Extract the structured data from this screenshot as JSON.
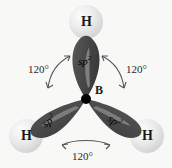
{
  "figure": {
    "background_color": "#f8f8f6",
    "central_atom": {
      "element": "B",
      "label": "B",
      "nucleus_color": "#000000"
    },
    "orbital_color": "#4a4a4a",
    "orbital_highlight_color": "#cfcfcf",
    "hydrogen_color": "#e8e8e8",
    "hydrogen_label": "H",
    "orbital_label_base": "sp",
    "orbital_label_exponent": "2",
    "angle_value": "120°",
    "orbitals": [
      {
        "id": "orbital-top",
        "label_base": "sp",
        "label_exponent": "2",
        "direction": "up",
        "bonded_atom": "H"
      },
      {
        "id": "orbital-lower-left",
        "label_base": "sp",
        "label_exponent": "2",
        "direction": "down-left",
        "bonded_atom": "H"
      },
      {
        "id": "orbital-lower-right",
        "label_base": "sp",
        "label_exponent": "2",
        "direction": "down-right",
        "bonded_atom": "H"
      }
    ],
    "hydrogens": [
      {
        "id": "hydrogen-top",
        "label": "H"
      },
      {
        "id": "hydrogen-lower-left",
        "label": "H"
      },
      {
        "id": "hydrogen-lower-right",
        "label": "H"
      }
    ],
    "angles": [
      {
        "id": "angle-upper-left",
        "label": "120°"
      },
      {
        "id": "angle-upper-right",
        "label": "120°"
      },
      {
        "id": "angle-bottom",
        "label": "120°"
      }
    ]
  }
}
